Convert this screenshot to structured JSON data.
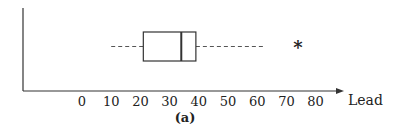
{
  "chart_data": {
    "type": "boxplot",
    "title": "",
    "caption": "(a)",
    "xlabel": "Lead",
    "ylabel": "",
    "orientation": "horizontal",
    "x_ticks": [
      0,
      10,
      20,
      30,
      40,
      50,
      60,
      70,
      80
    ],
    "x_tick_labels": [
      "0",
      "10",
      "20",
      "30",
      "40",
      "50",
      "60",
      "70",
      "80"
    ],
    "xlim": [
      -20,
      90
    ],
    "grid": false,
    "legend": null,
    "box": {
      "whisker_low": 10,
      "q1": 21,
      "median": 34,
      "q3": 39,
      "whisker_high": 62,
      "whisker_style": "dashed"
    },
    "outliers": [
      74
    ],
    "outlier_marker": "*"
  },
  "colors": {
    "axis": "#333333",
    "box": "#333333",
    "whisker": "#555555",
    "text": "#222222"
  }
}
